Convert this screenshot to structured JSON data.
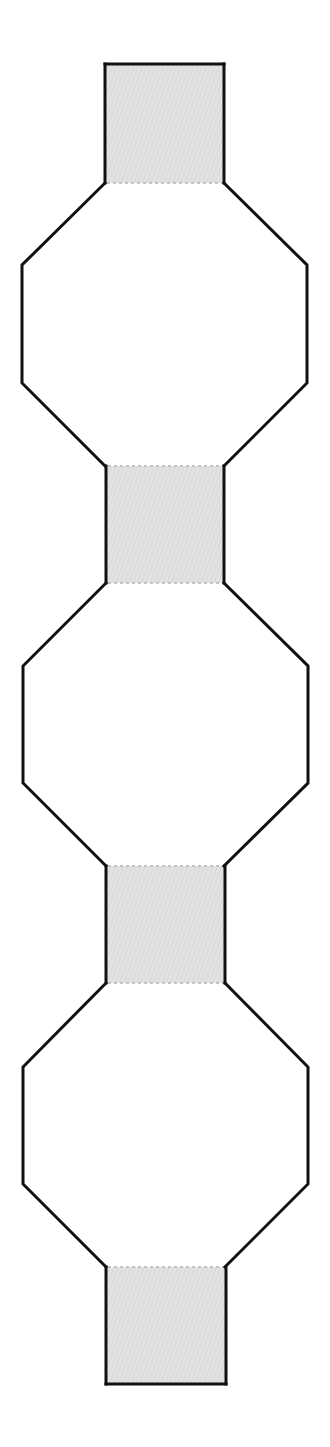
{
  "diagram": {
    "type": "vertical net: 4 shaded rectangles alternating with 3 octagons",
    "colors": {
      "background": "#ffffff",
      "outline": "#111111",
      "tab_fill": "#e2e2e2",
      "tab_hatch": "#d2d2d2",
      "fold_line": "#c4c4c4"
    },
    "tabs": [
      {
        "id": "tab-1",
        "x1": 105,
        "x2": 224,
        "y1": 64,
        "y2": 183,
        "open_top": false,
        "open_bottom": true
      },
      {
        "id": "tab-2",
        "x1": 106,
        "x2": 224,
        "y1": 466,
        "y2": 583,
        "open_top": true,
        "open_bottom": true
      },
      {
        "id": "tab-3",
        "x1": 106,
        "x2": 225,
        "y1": 866,
        "y2": 983,
        "open_top": true,
        "open_bottom": true
      },
      {
        "id": "tab-4",
        "x1": 106,
        "x2": 226,
        "y1": 1267,
        "y2": 1384,
        "open_top": true,
        "open_bottom": false
      }
    ],
    "octagons": [
      {
        "id": "octagon-1",
        "top": 183,
        "upper_mid": 265,
        "lower_mid": 383,
        "bottom": 466,
        "left": 22,
        "right": 307,
        "inner_left": 105,
        "inner_right": 224
      },
      {
        "id": "octagon-2",
        "top": 583,
        "upper_mid": 666,
        "lower_mid": 783,
        "bottom": 866,
        "left": 23,
        "right": 308,
        "inner_left": 106,
        "inner_right": 224
      },
      {
        "id": "octagon-3",
        "top": 983,
        "upper_mid": 1067,
        "lower_mid": 1184,
        "bottom": 1267,
        "left": 23,
        "right": 308,
        "inner_left": 106,
        "inner_right": 225
      }
    ]
  }
}
